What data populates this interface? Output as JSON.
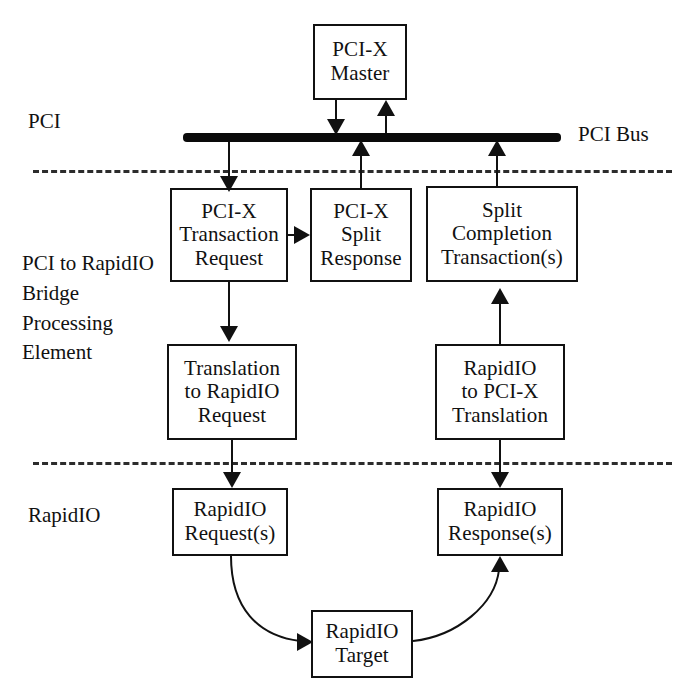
{
  "diagram": {
    "colors": {
      "line": "#111111",
      "bus": "#0a0a0a",
      "divider": "#2c2c2c",
      "background": "#ffffff"
    },
    "side_labels": [
      {
        "id": "pci",
        "text": "PCI"
      },
      {
        "id": "bridge",
        "text": "PCI to RapidIO\nBridge\nProcessing\nElement"
      },
      {
        "id": "rapidio",
        "text": "RapidIO"
      }
    ],
    "bus_label": "PCI Bus",
    "boxes": [
      {
        "id": "pci-x-master",
        "lines": [
          "PCI-X",
          "Master"
        ]
      },
      {
        "id": "pci-x-transaction-request",
        "lines": [
          "PCI-X",
          "Transaction",
          "Request"
        ]
      },
      {
        "id": "pci-x-split-response",
        "lines": [
          "PCI-X",
          "Split",
          "Response"
        ]
      },
      {
        "id": "split-completion",
        "lines": [
          "Split",
          "Completion",
          "Transaction(s)"
        ]
      },
      {
        "id": "translation-to-rapidio",
        "lines": [
          "Translation",
          "to RapidIO",
          "Request"
        ]
      },
      {
        "id": "rapidio-to-pci-x",
        "lines": [
          "RapidIO",
          "to PCI-X",
          "Translation"
        ]
      },
      {
        "id": "rapidio-request",
        "lines": [
          "RapidIO",
          "Request(s)"
        ]
      },
      {
        "id": "rapidio-response",
        "lines": [
          "RapidIO",
          "Response(s)"
        ]
      },
      {
        "id": "rapidio-target",
        "lines": [
          "RapidIO",
          "Target"
        ]
      }
    ]
  }
}
